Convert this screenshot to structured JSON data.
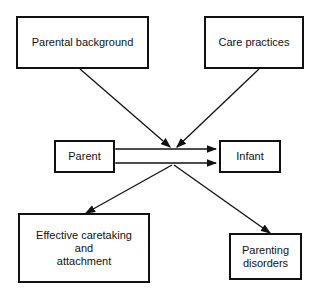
{
  "diagram": {
    "nodes": {
      "parental_background": {
        "label": "Parental background"
      },
      "care_practices": {
        "label": "Care practices"
      },
      "parent": {
        "label": "Parent"
      },
      "infant": {
        "label": "Infant"
      },
      "effective_caretaking": {
        "line1": "Effective caretaking",
        "line2": "and",
        "line3": "attachment"
      },
      "parenting_disorders": {
        "line1": "Parenting",
        "line2": "disorders"
      }
    },
    "edges": [
      {
        "from": "parental_background",
        "to": "parent-infant-interaction"
      },
      {
        "from": "care_practices",
        "to": "parent-infant-interaction"
      },
      {
        "from": "parent",
        "to": "infant",
        "bidirectional": true
      },
      {
        "from": "parent-infant-interaction",
        "to": "effective_caretaking"
      },
      {
        "from": "parent-infant-interaction",
        "to": "parenting_disorders"
      }
    ]
  }
}
